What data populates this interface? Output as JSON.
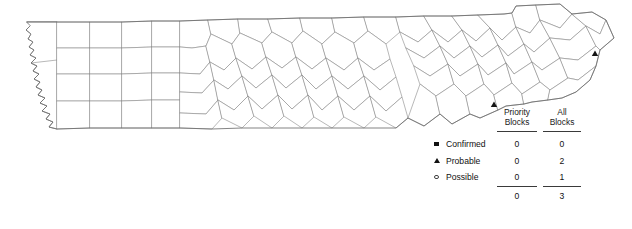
{
  "map": {
    "title": "Tennessee county outline map",
    "region_name": "Tennessee",
    "fill_color": "#ffffff",
    "county_line_color": "#8c8c8c",
    "state_line_color": "#6e6e6e",
    "markers": [
      {
        "type": "probable",
        "shape": "triangle",
        "x": 595,
        "y": 54,
        "color": "#141414"
      },
      {
        "type": "probable",
        "shape": "triangle",
        "x": 494,
        "y": 105,
        "color": "#141414"
      }
    ]
  },
  "legend": {
    "columns": [
      {
        "line1": "Priority",
        "line2": "Blocks"
      },
      {
        "line1": "All",
        "line2": "Blocks"
      }
    ],
    "rows": [
      {
        "marker": "filled-square",
        "label": "Confirmed",
        "priority_blocks": "0",
        "all_blocks": "0"
      },
      {
        "marker": "filled-triangle",
        "label": "Probable",
        "priority_blocks": "0",
        "all_blocks": "2"
      },
      {
        "marker": "open-circle",
        "label": "Possible",
        "priority_blocks": "0",
        "all_blocks": "1"
      }
    ],
    "totals": {
      "priority_blocks": "0",
      "all_blocks": "3"
    }
  }
}
